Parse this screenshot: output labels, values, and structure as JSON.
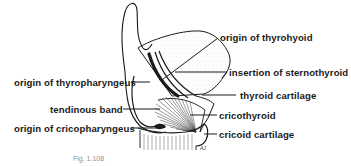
{
  "figure": {
    "caption": "Fig. 1.108",
    "artist_signature": "AJ",
    "colors": {
      "ink": "#1a1a1a",
      "background": "#ffffff",
      "stipple": "#d9d9d9"
    },
    "labels_left": [
      {
        "id": "origin-of-thyropharyngeus",
        "text": "origin of thyropharyngeus"
      },
      {
        "id": "tendinous-band",
        "text": "tendinous band"
      },
      {
        "id": "origin-of-cricopharyngeus",
        "text": "origin of cricopharyngeus"
      }
    ],
    "labels_right": [
      {
        "id": "origin-of-thyrohyoid",
        "text": "origin of thyrohyoid"
      },
      {
        "id": "insertion-of-sternothyroid",
        "text": "insertion of sternothyroid"
      },
      {
        "id": "thyroid-cartilage",
        "text": "thyroid cartilage"
      },
      {
        "id": "cricothyroid",
        "text": "cricothyroid"
      },
      {
        "id": "cricoid-cartilage",
        "text": "cricoid cartilage"
      }
    ]
  }
}
